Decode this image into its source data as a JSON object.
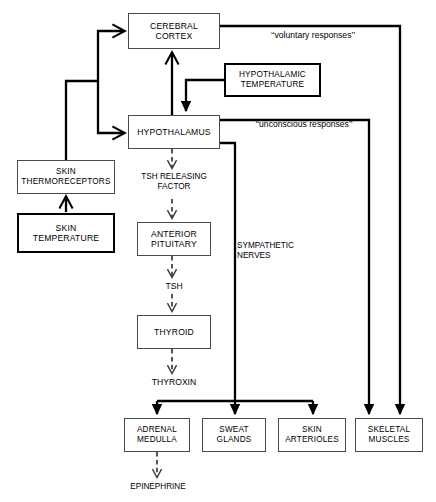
{
  "diagram": {
    "background_color": "#ffffff",
    "line_color": "#000000",
    "thin_border_color": "#4a4a4a",
    "nodes": [
      {
        "id": "cerebral-cortex",
        "label": "CEREBRAL\nCORTEX",
        "border": "thin",
        "x": 128,
        "y": 13,
        "w": 92,
        "h": 36,
        "font_size": 8.6
      },
      {
        "id": "hypothalamic-temperature",
        "label": "HYPOTHALAMIC\nTEMPERATURE",
        "border": "thick",
        "x": 224,
        "y": 63,
        "w": 97,
        "h": 34,
        "font_size": 8.2
      },
      {
        "id": "hypothalamus",
        "label": "HYPOTHALAMUS",
        "border": "thin",
        "x": 128,
        "y": 115,
        "w": 92,
        "h": 34,
        "font_size": 8.6
      },
      {
        "id": "skin-thermoreceptors",
        "label": "SKIN\nTHERMORECEPTORS",
        "border": "thin",
        "x": 17,
        "y": 160,
        "w": 98,
        "h": 34,
        "font_size": 8.2
      },
      {
        "id": "skin-temperature",
        "label": "SKIN\nTEMPERATURE",
        "border": "thick",
        "x": 17,
        "y": 213,
        "w": 98,
        "h": 40,
        "font_size": 8.6
      },
      {
        "id": "anterior-pituitary",
        "label": "ANTERIOR\nPITUITARY",
        "border": "thin",
        "x": 137,
        "y": 222,
        "w": 74,
        "h": 34,
        "font_size": 8.6
      },
      {
        "id": "thyroid",
        "label": "THYROID",
        "border": "thin",
        "x": 137,
        "y": 315,
        "w": 74,
        "h": 34,
        "font_size": 8.6
      },
      {
        "id": "adrenal-medulla",
        "label": "ADRENAL\nMEDULLA",
        "border": "thin",
        "x": 124,
        "y": 418,
        "w": 66,
        "h": 34,
        "font_size": 8.2
      },
      {
        "id": "sweat-glands",
        "label": "SWEAT\nGLANDS",
        "border": "thin",
        "x": 202,
        "y": 418,
        "w": 64,
        "h": 34,
        "font_size": 8.2
      },
      {
        "id": "skin-arterioles",
        "label": "SKIN\nARTERIOLES",
        "border": "thin",
        "x": 278,
        "y": 418,
        "w": 68,
        "h": 34,
        "font_size": 8.2
      },
      {
        "id": "skeletal-muscles",
        "label": "SKELETAL\nMUSCLES",
        "border": "thin",
        "x": 355,
        "y": 418,
        "w": 68,
        "h": 34,
        "font_size": 8.2
      }
    ],
    "free_texts": [
      {
        "id": "voluntary-responses",
        "text": "‘‘voluntary responses’’",
        "x": 243,
        "y": 30,
        "w": 140,
        "font_size": 8.6,
        "align": "center"
      },
      {
        "id": "unconscious-responses",
        "text": "‘‘unconscious responses’’",
        "x": 229,
        "y": 119,
        "w": 150,
        "font_size": 8.6,
        "align": "center"
      },
      {
        "id": "tsh-releasing-factor",
        "text": "TSH RELEASING\nFACTOR",
        "x": 131,
        "y": 172,
        "w": 86,
        "font_size": 8.2,
        "align": "center"
      },
      {
        "id": "tsh",
        "text": "TSH",
        "x": 150,
        "y": 281,
        "w": 48,
        "font_size": 8.6,
        "align": "center"
      },
      {
        "id": "thyroxin",
        "text": "THYROXIN",
        "x": 140,
        "y": 377,
        "w": 68,
        "font_size": 8.6,
        "align": "center"
      },
      {
        "id": "sympathetic-nerves",
        "text": "SYMPATHETIC\nNERVES",
        "x": 237,
        "y": 241,
        "w": 90,
        "font_size": 8.2,
        "align": "left"
      },
      {
        "id": "epinephrine",
        "text": "EPINEPHRINE",
        "x": 117,
        "y": 482,
        "w": 82,
        "font_size": 8.2,
        "align": "center"
      }
    ],
    "edges": [
      {
        "id": "skin-temperature-to-thermoreceptors",
        "style": "solid-thick",
        "from": "skin-temperature",
        "to": "skin-thermoreceptors"
      },
      {
        "id": "thermoreceptors-to-cerebral-cortex",
        "style": "solid-thick",
        "from": "skin-thermoreceptors",
        "to": "cerebral-cortex"
      },
      {
        "id": "thermoreceptors-to-hypothalamus",
        "style": "solid-thick",
        "from": "skin-thermoreceptors",
        "to": "hypothalamus"
      },
      {
        "id": "hypothalamic-temperature-to-hypothalamus",
        "style": "solid-thick",
        "from": "hypothalamic-temperature",
        "to": "hypothalamus"
      },
      {
        "id": "hypothalamus-to-cerebral-cortex",
        "style": "solid-thick",
        "from": "hypothalamus",
        "to": "cerebral-cortex"
      },
      {
        "id": "cerebral-cortex-to-skeletal-muscles",
        "style": "solid-thick",
        "from": "cerebral-cortex",
        "to": "skeletal-muscles",
        "label": "voluntary-responses"
      },
      {
        "id": "hypothalamus-to-skeletal-muscles",
        "style": "solid-thick",
        "from": "hypothalamus",
        "to": "skeletal-muscles",
        "label": "unconscious-responses"
      },
      {
        "id": "hypothalamus-sympathetic-trunk",
        "style": "solid-thick",
        "from": "hypothalamus",
        "to": "adrenal-medulla",
        "label": "sympathetic-nerves"
      },
      {
        "id": "hypothalamus-sympathetic-sweat",
        "style": "solid-thick",
        "from": "hypothalamus",
        "to": "sweat-glands",
        "label": "sympathetic-nerves"
      },
      {
        "id": "hypothalamus-sympathetic-arterioles",
        "style": "solid-thick",
        "from": "hypothalamus",
        "to": "skin-arterioles",
        "label": "sympathetic-nerves"
      },
      {
        "id": "hypothalamus-to-trf",
        "style": "dashed",
        "from": "hypothalamus",
        "to": "tsh-releasing-factor"
      },
      {
        "id": "trf-to-anterior-pituitary",
        "style": "dashed",
        "from": "tsh-releasing-factor",
        "to": "anterior-pituitary"
      },
      {
        "id": "anterior-pituitary-to-tsh",
        "style": "dashed",
        "from": "anterior-pituitary",
        "to": "tsh"
      },
      {
        "id": "tsh-to-thyroid",
        "style": "dashed",
        "from": "tsh",
        "to": "thyroid"
      },
      {
        "id": "thyroid-to-thyroxin",
        "style": "dashed",
        "from": "thyroid",
        "to": "thyroxin"
      },
      {
        "id": "adrenal-medulla-to-epinephrine",
        "style": "dashed",
        "from": "adrenal-medulla",
        "to": "epinephrine"
      }
    ]
  }
}
